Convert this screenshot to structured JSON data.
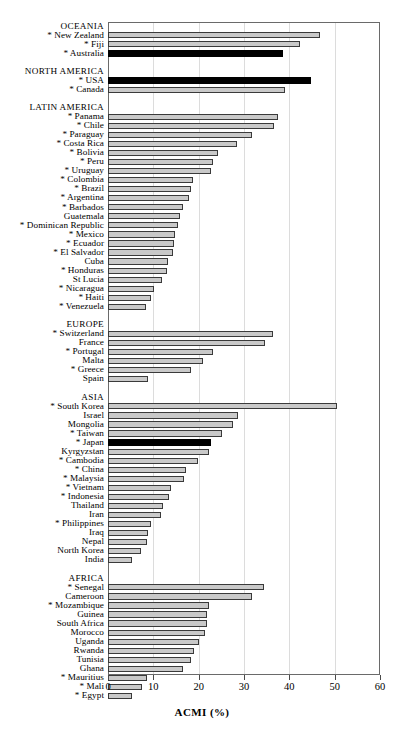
{
  "chart_data": {
    "type": "bar",
    "orientation": "horizontal",
    "title": "",
    "xlabel": "ACMI (%)",
    "ylabel": "",
    "xlim": [
      0,
      60
    ],
    "xticks": [
      0,
      10,
      20,
      30,
      40,
      50,
      60
    ],
    "grid": true,
    "legend": null,
    "series_note": "Black bars denote highlighted countries; grey bars are standard.",
    "groups": [
      {
        "name": "OCEANIA",
        "items": [
          {
            "label": "* New Zealand",
            "value": 46.8,
            "highlight": false
          },
          {
            "label": "* Fiji",
            "value": 42.3,
            "highlight": false
          },
          {
            "label": "* Australia",
            "value": 38.5,
            "highlight": true
          }
        ]
      },
      {
        "name": "NORTH AMERICA",
        "items": [
          {
            "label": "* USA",
            "value": 44.8,
            "highlight": true
          },
          {
            "label": "* Canada",
            "value": 39.0,
            "highlight": false
          }
        ]
      },
      {
        "name": "LATIN AMERICA",
        "items": [
          {
            "label": "* Panama",
            "value": 37.4,
            "highlight": false
          },
          {
            "label": "* Chile",
            "value": 36.6,
            "highlight": false
          },
          {
            "label": "* Paraguay",
            "value": 31.8,
            "highlight": false
          },
          {
            "label": "* Costa Rica",
            "value": 28.4,
            "highlight": false
          },
          {
            "label": "* Bolivia",
            "value": 24.3,
            "highlight": false
          },
          {
            "label": "* Peru",
            "value": 23.2,
            "highlight": false
          },
          {
            "label": "* Uruguay",
            "value": 22.7,
            "highlight": false
          },
          {
            "label": "* Colombia",
            "value": 18.7,
            "highlight": false
          },
          {
            "label": "* Brazil",
            "value": 18.4,
            "highlight": false
          },
          {
            "label": "* Argentina",
            "value": 17.8,
            "highlight": false
          },
          {
            "label": "* Barbados",
            "value": 16.5,
            "highlight": false
          },
          {
            "label": "Guatemala",
            "value": 15.9,
            "highlight": false
          },
          {
            "label": "* Dominican Republic",
            "value": 15.4,
            "highlight": false
          },
          {
            "label": "* Mexico",
            "value": 14.8,
            "highlight": false
          },
          {
            "label": "* Ecuador",
            "value": 14.6,
            "highlight": false
          },
          {
            "label": "* El Salvador",
            "value": 14.3,
            "highlight": false
          },
          {
            "label": "Cuba",
            "value": 13.3,
            "highlight": false
          },
          {
            "label": "* Honduras",
            "value": 13.0,
            "highlight": false
          },
          {
            "label": "St Lucia",
            "value": 11.9,
            "highlight": false
          },
          {
            "label": "* Nicaragua",
            "value": 10.1,
            "highlight": false
          },
          {
            "label": "* Haiti",
            "value": 9.5,
            "highlight": false
          },
          {
            "label": "* Venezuela",
            "value": 8.4,
            "highlight": false
          }
        ]
      },
      {
        "name": "EUROPE",
        "items": [
          {
            "label": "* Switzerland",
            "value": 36.3,
            "highlight": false
          },
          {
            "label": "France",
            "value": 34.6,
            "highlight": false
          },
          {
            "label": "* Portugal",
            "value": 23.1,
            "highlight": false
          },
          {
            "label": "Malta",
            "value": 21.0,
            "highlight": false
          },
          {
            "label": "* Greece",
            "value": 18.3,
            "highlight": false
          },
          {
            "label": "Spain",
            "value": 8.8,
            "highlight": false
          }
        ]
      },
      {
        "name": "ASIA",
        "items": [
          {
            "label": "* South Korea",
            "value": 50.5,
            "highlight": false
          },
          {
            "label": "Israel",
            "value": 28.7,
            "highlight": false
          },
          {
            "label": "Mongolia",
            "value": 27.6,
            "highlight": false
          },
          {
            "label": "* Taiwan",
            "value": 25.1,
            "highlight": false
          },
          {
            "label": "* Japan",
            "value": 22.7,
            "highlight": true
          },
          {
            "label": "Kyrgyzstan",
            "value": 22.3,
            "highlight": false
          },
          {
            "label": "* Cambodia",
            "value": 19.8,
            "highlight": false
          },
          {
            "label": "* China",
            "value": 17.2,
            "highlight": false
          },
          {
            "label": "* Malaysia",
            "value": 16.8,
            "highlight": false
          },
          {
            "label": "* Vietnam",
            "value": 13.8,
            "highlight": false
          },
          {
            "label": "* Indonesia",
            "value": 13.4,
            "highlight": false
          },
          {
            "label": "Thailand",
            "value": 12.2,
            "highlight": false
          },
          {
            "label": "Iran",
            "value": 11.7,
            "highlight": false
          },
          {
            "label": "* Philippines",
            "value": 9.4,
            "highlight": false
          },
          {
            "label": "Iraq",
            "value": 8.8,
            "highlight": false
          },
          {
            "label": "Nepal",
            "value": 8.6,
            "highlight": false
          },
          {
            "label": "North Korea",
            "value": 7.2,
            "highlight": false
          },
          {
            "label": "India",
            "value": 5.3,
            "highlight": false
          }
        ]
      },
      {
        "name": "AFRICA",
        "items": [
          {
            "label": "* Senegal",
            "value": 34.4,
            "highlight": false
          },
          {
            "label": "Cameroon",
            "value": 31.7,
            "highlight": false
          },
          {
            "label": "* Mozambique",
            "value": 22.2,
            "highlight": false
          },
          {
            "label": "Guinea",
            "value": 21.8,
            "highlight": false
          },
          {
            "label": "South Africa",
            "value": 21.8,
            "highlight": false
          },
          {
            "label": "Morocco",
            "value": 21.4,
            "highlight": false
          },
          {
            "label": "Uganda",
            "value": 20.0,
            "highlight": false
          },
          {
            "label": "Rwanda",
            "value": 19.0,
            "highlight": false
          },
          {
            "label": "Tunisia",
            "value": 18.4,
            "highlight": false
          },
          {
            "label": "Ghana",
            "value": 16.5,
            "highlight": false
          },
          {
            "label": "* Mauritius",
            "value": 8.7,
            "highlight": false
          },
          {
            "label": "* Mali",
            "value": 7.6,
            "highlight": false
          },
          {
            "label": "* Egypt",
            "value": 5.2,
            "highlight": false
          }
        ]
      }
    ]
  },
  "axis": {
    "title": "ACMI  (%)",
    "tick_labels": [
      "0",
      "10",
      "20",
      "30",
      "40",
      "50",
      "60"
    ]
  },
  "colors": {
    "bar_fill": "#c9c9c9",
    "bar_edge": "#3a3a3a",
    "bar_highlight": "#000000",
    "frame": "#6a6a6a",
    "grid": "#dcdcdc",
    "background": "#ffffff"
  }
}
